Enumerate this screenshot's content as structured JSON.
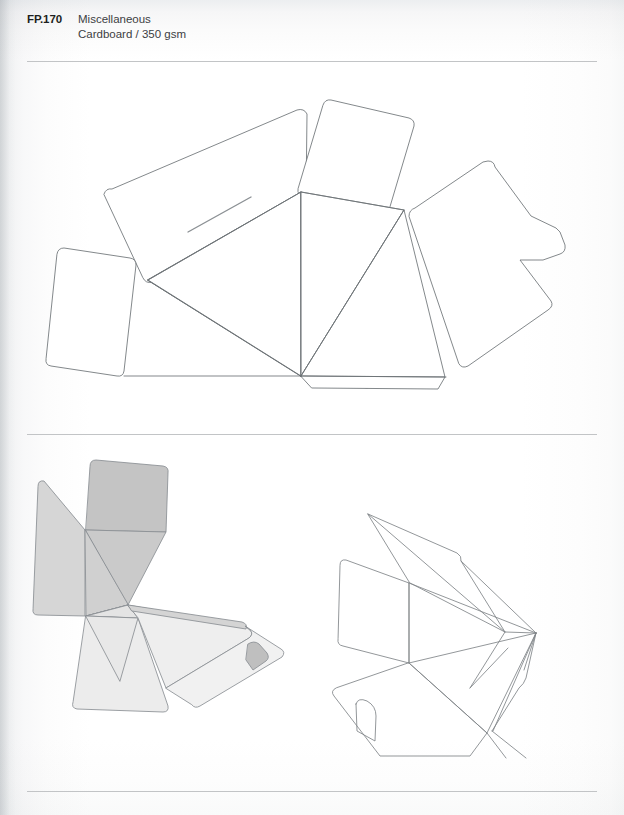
{
  "header": {
    "code": "FP.170",
    "category": "Miscellaneous",
    "material": "Cardboard / 350 gsm"
  },
  "dividers": {
    "top_label": "header-rule",
    "middle_label": "section-rule",
    "bottom_label": "footer-rule"
  },
  "figures": {
    "dieline": {
      "label": "Dieline / flat unfolded template",
      "line_color": "#6d7276",
      "fill_color": "#ffffff"
    },
    "render_left": {
      "label": "Shaded 3D assembly view",
      "line_color": "#8a8f93",
      "shades": {
        "panel_dark": "#c4c4c4",
        "panel_mid": "#cfcfcf",
        "panel_light": "#d8d8d8",
        "panel_pale": "#e7e7e7",
        "panel_faint": "#f1f1f1",
        "tab_slot": "#bfbfbf"
      }
    },
    "render_right": {
      "label": "Wireframe 3D open view",
      "line_color": "#7f8488",
      "fill_color": "none"
    }
  },
  "page": {
    "background": "#ffffff",
    "rule_color": "#c2c4c6"
  }
}
